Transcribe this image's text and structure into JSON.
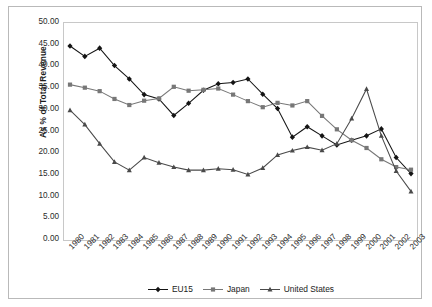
{
  "chart_data": {
    "type": "line",
    "title": "",
    "xlabel": "",
    "ylabel": "As % of Total Revenue",
    "ylim": [
      0,
      50
    ],
    "ytick_step": 5,
    "grid": false,
    "legend_position": "bottom",
    "categories": [
      "1980",
      "1981",
      "1982",
      "1983",
      "1984",
      "1985",
      "1986",
      "1987",
      "1988",
      "1989",
      "1990",
      "1991",
      "1992",
      "1993",
      "1994",
      "1995",
      "1996",
      "1997",
      "1998",
      "1999",
      "2000",
      "2001",
      "2002",
      "2003"
    ],
    "ytick_labels": [
      "50.00",
      "45.00",
      "40.00",
      "35.00",
      "30.00",
      "25.00",
      "20.00",
      "15.00",
      "10.00",
      "5.00",
      "0.00"
    ],
    "series": [
      {
        "name": "EU15",
        "color": "#141414",
        "marker": "diamond",
        "values": [
          44.7,
          42.3,
          44.2,
          40.2,
          37.1,
          33.5,
          32.5,
          28.7,
          31.5,
          34.5,
          36.0,
          36.3,
          37.1,
          33.6,
          30.3,
          23.7,
          26.1,
          24.0,
          21.9,
          23.0,
          24.0,
          25.6,
          19.0,
          15.3
        ]
      },
      {
        "name": "Japan",
        "color": "#777777",
        "marker": "square",
        "values": [
          35.8,
          35.1,
          34.3,
          32.5,
          31.1,
          32.1,
          32.6,
          35.3,
          34.4,
          34.6,
          34.9,
          33.5,
          32.0,
          30.6,
          31.6,
          31.0,
          32.0,
          28.6,
          25.5,
          23.0,
          21.2,
          18.6,
          16.8,
          16.2
        ]
      },
      {
        "name": "United States",
        "color": "#4a4a4a",
        "marker": "triangle",
        "values": [
          29.9,
          26.6,
          22.2,
          18.0,
          16.1,
          19.0,
          17.8,
          16.8,
          16.1,
          16.1,
          16.4,
          16.2,
          15.1,
          16.6,
          19.6,
          20.6,
          21.4,
          20.7,
          22.2,
          28.0,
          34.8,
          24.0,
          15.9,
          11.2
        ]
      }
    ]
  },
  "legend": {
    "items": [
      {
        "label": "EU15"
      },
      {
        "label": "Japan"
      },
      {
        "label": "United States"
      }
    ]
  }
}
